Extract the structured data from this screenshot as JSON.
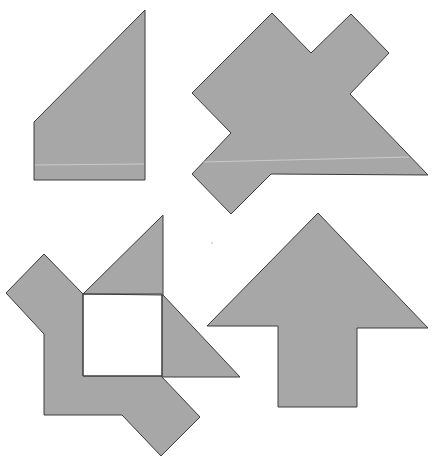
{
  "colors": {
    "background": "#ffffff",
    "fill": "#a7a7a7",
    "stroke": "#3c3c3c",
    "highlight": "#d2d2d2"
  },
  "figures": [
    {
      "id": "figure-1",
      "name": "trapezoid-silhouette",
      "points": "145,10 145,180 34,180 34,122",
      "highlight": "35,165 144,164"
    },
    {
      "id": "figure-2",
      "name": "double-diamond-silhouette",
      "points": "272,13 311,53 351,14 389,53 350,94 428,175 271,174 231,214 192,174 231,133 192,93",
      "highlight": "203,162 409,157"
    },
    {
      "id": "figure-3",
      "name": "pinwheel-silhouette",
      "outer_points": "44,254 83,294 163,215 163,295 240,377 162,377 200,417 161,456 122,415 44,415 44,334 6,293",
      "hole_points": "83,294 162,294 162,376 83,376",
      "inner_lines": [
        "83,294 163,295",
        "162,295 162,377",
        "83,376 162,376",
        "83,294 83,376"
      ]
    },
    {
      "id": "figure-4",
      "name": "arrow-silhouette",
      "points": "318,213 428,328 357,328 357,407 278,407 278,326 207,326"
    }
  ],
  "speck": {
    "x": 212,
    "y": 243
  }
}
